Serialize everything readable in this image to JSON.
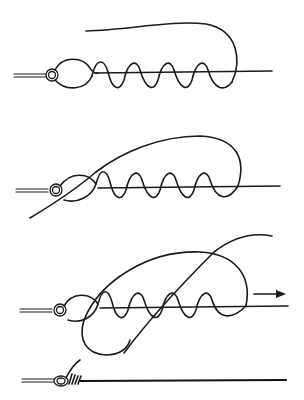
{
  "diagram": {
    "type": "knot-tying-instructions",
    "background": "#ffffff",
    "ink_color": "#1a1a1a",
    "steps": [
      {
        "index": 1,
        "description": "Tag end passed through eye and wrapped around standing line",
        "wraps": 4,
        "has_arrow": false
      },
      {
        "index": 2,
        "description": "Tag end brought back through the loop near the eye",
        "wraps": 4,
        "has_arrow": false
      },
      {
        "index": 3,
        "description": "Tag end passed through the big loop, standing line pulled",
        "wraps": 4,
        "has_arrow": true,
        "arrow_direction": "right"
      },
      {
        "index": 4,
        "description": "Finished knot tightened against the eye",
        "wraps": 4,
        "has_arrow": false
      }
    ]
  }
}
